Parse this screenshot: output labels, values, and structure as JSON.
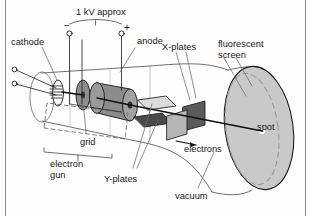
{
  "figure": {
    "title_alt": "Cathode ray tube (CRT) cross-section diagram",
    "background": "#fefefe",
    "border_color": "#888888"
  },
  "labels": {
    "supply": "1 kV approx",
    "minus": "−",
    "plus": "+",
    "cathode": "cathode",
    "anode": "anode",
    "grid": "grid",
    "electron_gun_line1": "electron",
    "electron_gun_line2": "gun",
    "x_plates": "X-plates",
    "y_plates": "Y-plates",
    "fluorescent_line1": "fluorescent",
    "fluorescent_line2": "screen",
    "electrons": "electrons",
    "vacuum": "vacuum",
    "spot": "spot"
  },
  "colors": {
    "outline": "#1a1a1a",
    "text": "#1a1a1a",
    "leader": "#555555",
    "cathode_coil": "#303030",
    "grid_disc": "#8e8e8e",
    "grid_core": "#3a3a3a",
    "anode_body": "#8c8c8c",
    "anode_cap": "#a2a2a2",
    "anode_core": "#2e2e2e",
    "yplate_top": "#d8d8d8",
    "yplate_bottom": "#4a4a4a",
    "xplate_front": "#b6b6b6",
    "xplate_back": "#5a5a5a",
    "screen_face": "#c9c9c9",
    "screen_dash": "#9a9a9a",
    "spot_fill": "#ffffff",
    "beam": "#111111"
  },
  "parts": [
    {
      "name": "cathode",
      "kind": "heater-coil"
    },
    {
      "name": "grid",
      "kind": "disc"
    },
    {
      "name": "anode",
      "kind": "cylinder"
    },
    {
      "name": "y-plates",
      "kind": "plate-pair-horizontal"
    },
    {
      "name": "x-plates",
      "kind": "plate-pair-vertical"
    },
    {
      "name": "fluorescent-screen",
      "kind": "ellipse-face"
    },
    {
      "name": "vacuum-envelope",
      "kind": "flared-tube"
    },
    {
      "name": "electron-beam",
      "kind": "arrow-line"
    },
    {
      "name": "spot",
      "kind": "bright-point"
    }
  ]
}
